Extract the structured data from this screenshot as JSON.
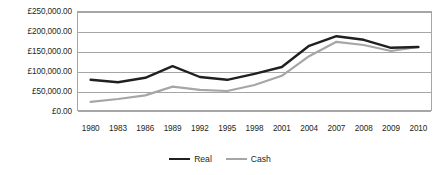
{
  "chart_data": {
    "type": "line",
    "title": "",
    "xlabel": "",
    "ylabel": "",
    "categories": [
      "1980",
      "1983",
      "1986",
      "1989",
      "1992",
      "1995",
      "1998",
      "2001",
      "2004",
      "2007",
      "2008",
      "2009",
      "2010"
    ],
    "ylim": [
      0,
      250000
    ],
    "ytick_values": [
      250000,
      200000,
      150000,
      100000,
      50000,
      0
    ],
    "ytick_labels": [
      "£250,000.00",
      "£200,000.00",
      "£150,000.00",
      "£100,000.00",
      "£50,000.00",
      "£0.00"
    ],
    "grid": true,
    "legend_position": "bottom",
    "series": [
      {
        "name": "Real",
        "color": "#231f20",
        "values": [
          78000,
          72000,
          83000,
          112000,
          85000,
          78000,
          93000,
          110000,
          163000,
          187000,
          178000,
          158000,
          160000
        ]
      },
      {
        "name": "Cash",
        "color": "#a6a6a6",
        "values": [
          23000,
          30000,
          39000,
          61000,
          53000,
          50000,
          65000,
          88000,
          137000,
          173000,
          165000,
          150000,
          160000
        ]
      }
    ]
  },
  "legend": {
    "entries": [
      {
        "label": "Real"
      },
      {
        "label": "Cash"
      }
    ]
  },
  "colors": {
    "real": "#231f20",
    "cash": "#a6a6a6",
    "gridline": "#a6a6a6",
    "background": "#ffffff",
    "text": "#231f20"
  }
}
